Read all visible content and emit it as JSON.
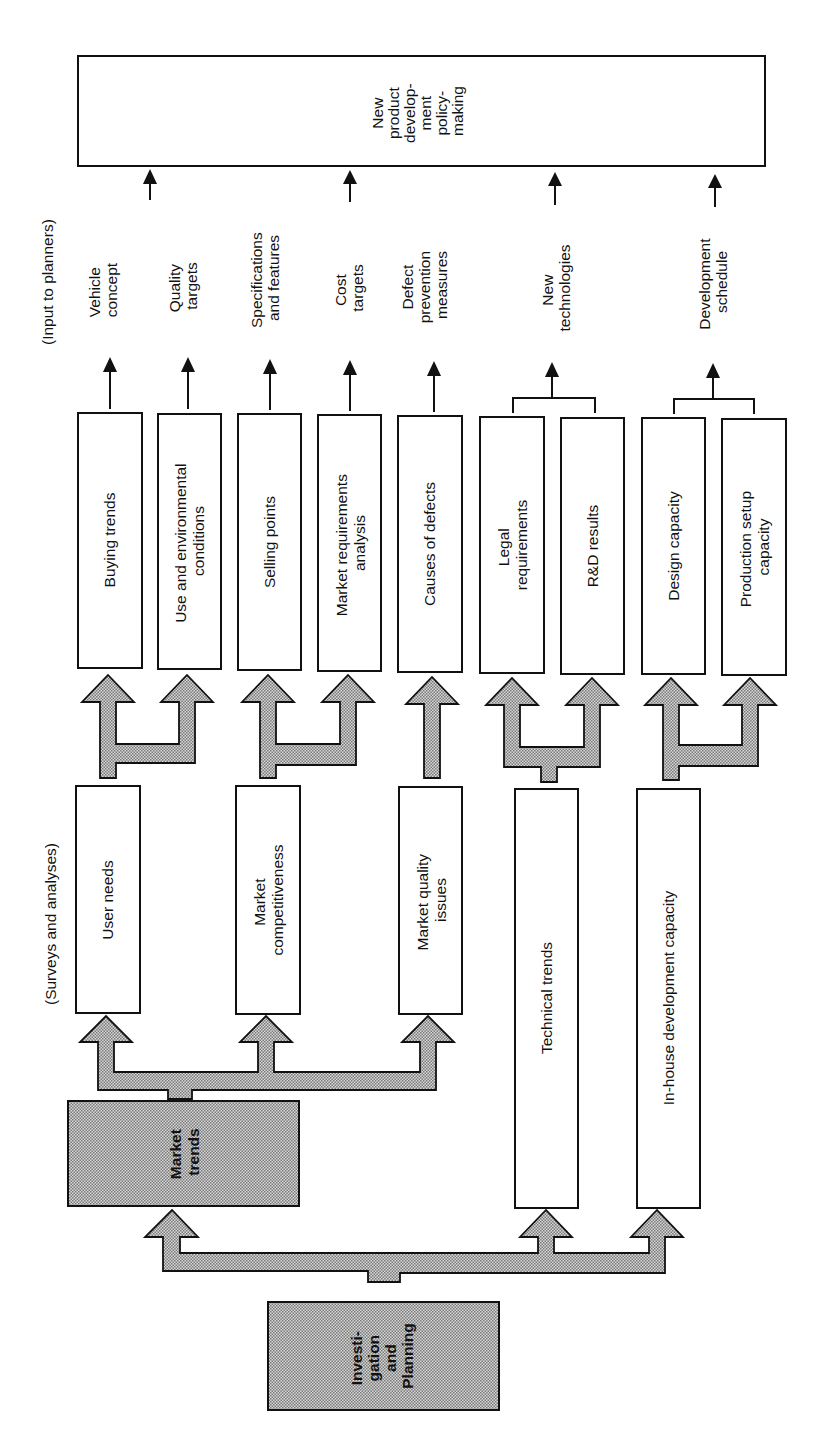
{
  "diagram": {
    "orientation": "rotated-90-ccw",
    "colors": {
      "line": "#111111",
      "shade": "#b8b8b8",
      "background": "#ffffff"
    },
    "top_box": {
      "lines": [
        "New",
        "product",
        "develop-",
        "ment",
        "policy-",
        "making"
      ]
    },
    "section_labels": {
      "input_to_planners": "(Input to planners)",
      "surveys_and_analyses": "(Surveys and analyses)"
    },
    "outputs": [
      {
        "id": "vehicle-concept",
        "lines": [
          "Vehicle",
          "concept"
        ]
      },
      {
        "id": "quality-targets",
        "lines": [
          "Quality",
          "targets"
        ]
      },
      {
        "id": "specifications-and-features",
        "lines": [
          "Specifications",
          "and features"
        ]
      },
      {
        "id": "cost-targets",
        "lines": [
          "Cost",
          "targets"
        ]
      },
      {
        "id": "defect-prevention-measures",
        "lines": [
          "Defect",
          "prevention",
          "measures"
        ]
      },
      {
        "id": "new-technologies",
        "lines": [
          "New",
          "technologies"
        ]
      },
      {
        "id": "development-schedule",
        "lines": [
          "Development",
          "schedule"
        ]
      }
    ],
    "analyses": [
      {
        "id": "buying-trends",
        "lines": [
          "Buying trends"
        ]
      },
      {
        "id": "use-and-environmental-conditions",
        "lines": [
          "Use and environmental",
          "conditions"
        ]
      },
      {
        "id": "selling-points",
        "lines": [
          "Selling points"
        ]
      },
      {
        "id": "market-requirements-analysis",
        "lines": [
          "Market requirements",
          "analysis"
        ]
      },
      {
        "id": "causes-of-defects",
        "lines": [
          "Causes of defects"
        ]
      },
      {
        "id": "legal-requirements",
        "lines": [
          "Legal",
          "requirements"
        ]
      },
      {
        "id": "rd-results",
        "lines": [
          "R&D results"
        ]
      },
      {
        "id": "design-capacity",
        "lines": [
          "Design capacity"
        ]
      },
      {
        "id": "production-setup-capacity",
        "lines": [
          "Production setup",
          "capacity"
        ]
      }
    ],
    "surveys": [
      {
        "id": "user-needs",
        "lines": [
          "User needs"
        ]
      },
      {
        "id": "market-competitiveness",
        "lines": [
          "Market",
          "competitiveness"
        ]
      },
      {
        "id": "market-quality-issues",
        "lines": [
          "Market quality",
          "issues"
        ]
      },
      {
        "id": "technical-trends",
        "lines": [
          "Technical trends"
        ]
      },
      {
        "id": "in-house-development-capacity",
        "lines": [
          "In-house development capacity"
        ]
      }
    ],
    "market_trends": {
      "lines": [
        "Market",
        "trends"
      ]
    },
    "root": {
      "lines": [
        "Investi-",
        "gation",
        "and",
        "Planning"
      ]
    }
  }
}
